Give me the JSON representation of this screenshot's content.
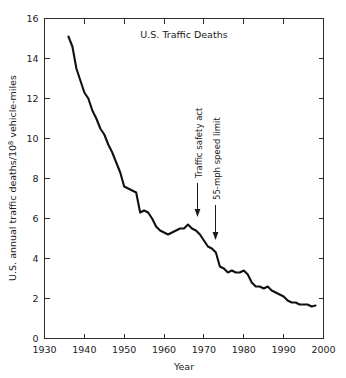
{
  "chart_data": {
    "type": "line",
    "title": "U.S. Traffic Deaths",
    "xlabel": "Year",
    "ylabel_parts": {
      "before": "U.S. annual traffic deaths/10",
      "superscript": "8",
      "after": " vehicle-miles"
    },
    "ylabel": "U.S. annual traffic deaths/10^8 vehicle-miles",
    "xlim": [
      1930,
      2000
    ],
    "ylim": [
      0,
      16
    ],
    "xticks": [
      1930,
      1940,
      1950,
      1960,
      1970,
      1980,
      1990,
      2000
    ],
    "xtick_labels": [
      "1930",
      "1940",
      "1950",
      "1960",
      "1970",
      "1980",
      "1990",
      "2000"
    ],
    "yticks": [
      0,
      2,
      4,
      6,
      8,
      10,
      12,
      14,
      16
    ],
    "ytick_labels": [
      "0",
      "2",
      "4",
      "6",
      "8",
      "10",
      "12",
      "14",
      "16"
    ],
    "grid": false,
    "legend": null,
    "line_color": "#111111",
    "frame": "full-box-inward-ticks",
    "x": [
      1936,
      1937,
      1938,
      1939,
      1940,
      1941,
      1942,
      1943,
      1944,
      1945,
      1946,
      1947,
      1948,
      1949,
      1950,
      1951,
      1952,
      1953,
      1954,
      1955,
      1956,
      1957,
      1958,
      1959,
      1960,
      1961,
      1962,
      1963,
      1964,
      1965,
      1966,
      1967,
      1968,
      1969,
      1970,
      1971,
      1972,
      1973,
      1974,
      1975,
      1976,
      1977,
      1978,
      1979,
      1980,
      1981,
      1982,
      1983,
      1984,
      1985,
      1986,
      1987,
      1988,
      1989,
      1990,
      1991,
      1992,
      1993,
      1994,
      1995,
      1996,
      1997,
      1998
    ],
    "y": [
      15.1,
      14.6,
      13.5,
      12.9,
      12.3,
      12.0,
      11.4,
      11.0,
      10.5,
      10.2,
      9.7,
      9.3,
      8.8,
      8.3,
      7.6,
      7.5,
      7.4,
      7.3,
      6.3,
      6.4,
      6.3,
      6.0,
      5.6,
      5.4,
      5.3,
      5.2,
      5.3,
      5.4,
      5.5,
      5.5,
      5.7,
      5.5,
      5.4,
      5.2,
      4.9,
      4.6,
      4.5,
      4.3,
      3.6,
      3.5,
      3.3,
      3.4,
      3.3,
      3.3,
      3.4,
      3.2,
      2.8,
      2.6,
      2.6,
      2.5,
      2.6,
      2.4,
      2.3,
      2.2,
      2.1,
      1.9,
      1.8,
      1.8,
      1.7,
      1.7,
      1.7,
      1.6,
      1.65
    ]
  },
  "annotations": [
    {
      "id": "traffic-safety-act",
      "label": "Traffic safety act",
      "year": 1966,
      "arrow": "down"
    },
    {
      "id": "speed-limit",
      "label": "55-mph speed limit",
      "year": 1973,
      "arrow": "down"
    }
  ]
}
